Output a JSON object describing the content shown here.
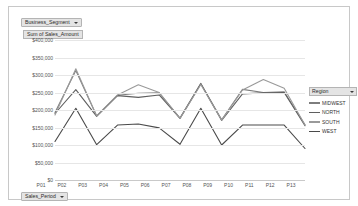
{
  "fields": {
    "row_field_label": "Business_Segment",
    "value_field_label": "Sum of Sales_Amount",
    "axis_field_label": "Sales_Period",
    "caret_icon": "chevron-down-icon"
  },
  "legend": {
    "title": "Region",
    "caret_icon": "chevron-down-icon",
    "items": [
      {
        "label": "MIDWEST",
        "color": "#7d7d7d"
      },
      {
        "label": "NORTH",
        "color": "#5f5f5f"
      },
      {
        "label": "SOUTH",
        "color": "#9a9a9a"
      },
      {
        "label": "WEST",
        "color": "#4a4a4a"
      }
    ]
  },
  "chart_data": {
    "type": "line",
    "title": "",
    "xlabel": "Sales_Period",
    "ylabel": "Sum of Sales_Amount",
    "ylim": [
      0,
      400000
    ],
    "ytick_values": [
      400000,
      350000,
      300000,
      250000,
      200000,
      150000,
      100000,
      50000,
      0
    ],
    "ytick_labels": [
      "$400,000",
      "$350,000",
      "$300,000",
      "$250,000",
      "$200,000",
      "$150,000",
      "$100,000",
      "$50,000",
      "$0"
    ],
    "grid": true,
    "legend_position": "right",
    "categories": [
      "P01",
      "P02",
      "P03",
      "P04",
      "P05",
      "P06",
      "P07",
      "P08",
      "P09",
      "P10",
      "P11",
      "P12",
      "P13"
    ],
    "series": [
      {
        "name": "MIDWEST",
        "color": "#7d7d7d",
        "values": [
          193000,
          313000,
          183000,
          242000,
          248000,
          249000,
          177000,
          276000,
          172000,
          259000,
          250000,
          252000,
          158000
        ]
      },
      {
        "name": "NORTH",
        "color": "#5f5f5f",
        "values": [
          190000,
          258000,
          182000,
          241000,
          236000,
          243000,
          176000,
          275000,
          170000,
          246000,
          249000,
          250000,
          155000
        ]
      },
      {
        "name": "SOUTH",
        "color": "#9a9a9a",
        "values": [
          186000,
          318000,
          183000,
          243000,
          272000,
          250000,
          176000,
          273000,
          171000,
          257000,
          287000,
          262000,
          157000
        ]
      },
      {
        "name": "WEST",
        "color": "#4a4a4a",
        "values": [
          110000,
          205000,
          101000,
          157000,
          160000,
          149000,
          102000,
          205000,
          100000,
          157000,
          157000,
          157000,
          90000
        ]
      }
    ]
  }
}
